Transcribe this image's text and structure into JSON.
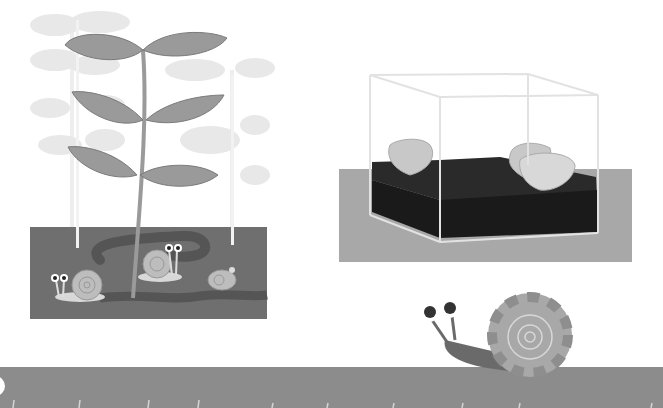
{
  "illustration": {
    "description": "Grayscale children's illustration of snails: a soil cross-section with plants and three small snails, a glass terrarium with soil and leaves, and a large snail crawling on a ground strip with tick marks.",
    "panels": [
      {
        "name": "plant-soil-panel",
        "snail_count": 3
      },
      {
        "name": "terrarium-panel",
        "leaf_count": 3
      },
      {
        "name": "large-snail-ground",
        "ruler_ticks": 10
      }
    ]
  },
  "colors": {
    "background": "#ffffff",
    "soil_panel": "#6f6f6f",
    "worm_tunnel": "#555555",
    "leaf_dark": "#9a9a9a",
    "leaf_light": "#e6e6e6",
    "terrarium_base": "#a8a8a8",
    "terrarium_soil": "#1e1e1e",
    "ground_strip": "#8c8c8c",
    "snail_shell": "#b4b4b4",
    "snail_body": "#6a6a6a"
  }
}
